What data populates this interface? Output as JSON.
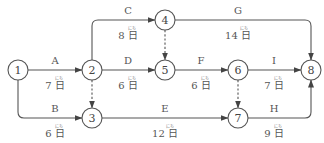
{
  "diagram": {
    "type": "activity-network",
    "unit": "日",
    "unit_ruby": "にち",
    "nodes": [
      {
        "id": "1",
        "label": "1",
        "x": 18,
        "y": 70
      },
      {
        "id": "2",
        "label": "2",
        "x": 92,
        "y": 70
      },
      {
        "id": "3",
        "label": "3",
        "x": 92,
        "y": 118
      },
      {
        "id": "4",
        "label": "4",
        "x": 165,
        "y": 20
      },
      {
        "id": "5",
        "label": "5",
        "x": 165,
        "y": 70
      },
      {
        "id": "6",
        "label": "6",
        "x": 238,
        "y": 70
      },
      {
        "id": "7",
        "label": "7",
        "x": 238,
        "y": 118
      },
      {
        "id": "8",
        "label": "8",
        "x": 311,
        "y": 70
      }
    ],
    "activities": [
      {
        "name": "A",
        "from": "1",
        "to": "2",
        "duration": "7",
        "duration_text": "7 日"
      },
      {
        "name": "B",
        "from": "1",
        "to": "3",
        "duration": "6",
        "duration_text": "6 日"
      },
      {
        "name": "C",
        "from": "2",
        "to": "4",
        "duration": "8",
        "duration_text": "8 日"
      },
      {
        "name": "D",
        "from": "2",
        "to": "5",
        "duration": "6",
        "duration_text": "6 日"
      },
      {
        "name": "E",
        "from": "3",
        "to": "7",
        "duration": "12",
        "duration_text": "12 日"
      },
      {
        "name": "F",
        "from": "5",
        "to": "6",
        "duration": "6",
        "duration_text": "6 日"
      },
      {
        "name": "G",
        "from": "4",
        "to": "8",
        "duration": "14",
        "duration_text": "14 日"
      },
      {
        "name": "H",
        "from": "7",
        "to": "8",
        "duration": "9",
        "duration_text": "9 日"
      },
      {
        "name": "I",
        "from": "6",
        "to": "8",
        "duration": "7",
        "duration_text": "7 日"
      }
    ],
    "dummy_activities": [
      {
        "from": "2",
        "to": "3"
      },
      {
        "from": "4",
        "to": "5"
      },
      {
        "from": "6",
        "to": "7"
      }
    ]
  }
}
